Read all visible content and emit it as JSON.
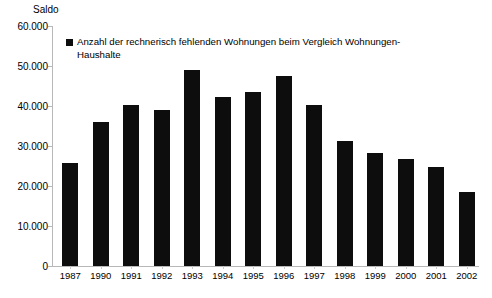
{
  "chart_data": {
    "type": "bar",
    "title": "",
    "ylabel": "Saldo",
    "xlabel": "",
    "categories": [
      "1987",
      "1990",
      "1991",
      "1992",
      "1993",
      "1994",
      "1995",
      "1996",
      "1997",
      "1998",
      "1999",
      "2000",
      "2001",
      "2002"
    ],
    "values": [
      25700,
      36000,
      40200,
      39100,
      49100,
      42200,
      43500,
      47600,
      40200,
      31200,
      28300,
      26700,
      24800,
      18400
    ],
    "series": [
      {
        "name": "Anzahl der rechnerisch fehlenden Wohnungen beim Vergleich Wohnungen-Haushalte",
        "values": [
          25700,
          36000,
          40200,
          39100,
          49100,
          42200,
          43500,
          47600,
          40200,
          31200,
          28300,
          26700,
          24800,
          18400
        ]
      }
    ],
    "ylim": [
      0,
      60000
    ],
    "ytick_labels": [
      "60.000",
      "50.000",
      "40.000",
      "30.000",
      "20.000",
      "10.000",
      "0"
    ],
    "ytick_values": [
      60000,
      50000,
      40000,
      30000,
      20000,
      10000,
      0
    ],
    "grid": false,
    "legend_position": "top-left",
    "bar_color": "#0d0d0d",
    "axis_color": "#b8b8b8"
  },
  "legend": {
    "label": "Anzahl der rechnerisch fehlenden Wohnungen beim Vergleich Wohnungen-Haushalte"
  },
  "axis": {
    "y_title": "Saldo"
  }
}
